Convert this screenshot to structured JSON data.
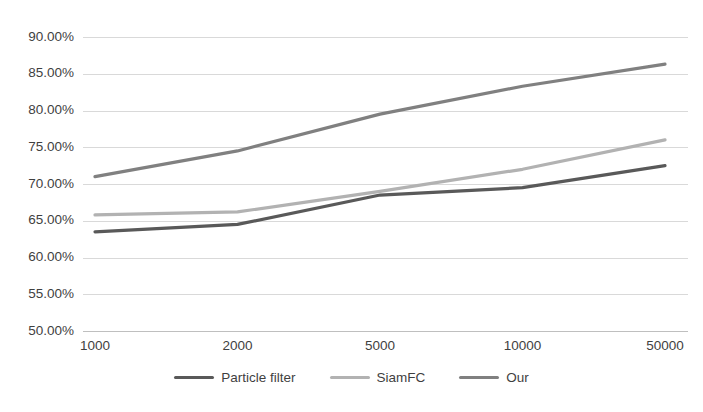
{
  "chart_data": {
    "type": "line",
    "title": "",
    "xlabel": "",
    "ylabel": "",
    "categories": [
      "1000",
      "2000",
      "5000",
      "10000",
      "50000"
    ],
    "x": [
      1000,
      2000,
      5000,
      10000,
      50000
    ],
    "series": [
      {
        "name": "Particle filter",
        "color": "#595959",
        "values": [
          63.5,
          64.5,
          68.5,
          69.5,
          72.5
        ],
        "value_labels": [
          "63.50%",
          "64.50%",
          "68.50%",
          "69.50%",
          "72.50%"
        ]
      },
      {
        "name": "SiamFC",
        "color": "#b2b2b2",
        "values": [
          65.8,
          66.2,
          69.0,
          72.0,
          76.0
        ],
        "value_labels": [
          "65.80%",
          "66.20%",
          "69.00%",
          "72.00%",
          "76.00%"
        ]
      },
      {
        "name": "Our",
        "color": "#808080",
        "values": [
          71.0,
          74.5,
          79.5,
          83.3,
          86.3
        ],
        "value_labels": [
          "71.00%",
          "74.50%",
          "79.50%",
          "83.30%",
          "86.30%"
        ]
      }
    ],
    "ylim": [
      50,
      90
    ],
    "ytick_values": [
      90,
      85,
      80,
      75,
      70,
      65,
      60,
      55,
      50
    ],
    "ytick_labels": [
      "90.00%",
      "85.00%",
      "80.00%",
      "75.00%",
      "70.00%",
      "65.00%",
      "60.00%",
      "55.00%",
      "50.00%"
    ],
    "xtick_labels": [
      "1000",
      "2000",
      "5000",
      "10000",
      "50000"
    ],
    "grid": {
      "horizontal": true,
      "vertical": false,
      "color": "#d9d9d9"
    },
    "legend": {
      "position": "bottom",
      "entries": [
        "Particle filter",
        "SiamFC",
        "Our"
      ]
    },
    "axis_colors": {
      "tick_text": "#3f3f3f",
      "axis_line": "#bfbfbf"
    }
  }
}
